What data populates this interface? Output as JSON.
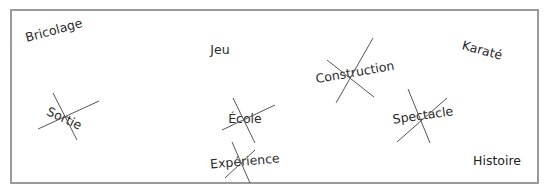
{
  "worksheet": {
    "frame": {
      "x": 11,
      "y": 10,
      "width": 527,
      "height": 173,
      "color": "#9a9a9a"
    },
    "words": [
      {
        "id": "bricolage",
        "text": "Bricolage",
        "x": 54,
        "y": 31,
        "rotate": -15,
        "crossed": false
      },
      {
        "id": "jeu",
        "text": "Jeu",
        "x": 220,
        "y": 50,
        "rotate": 0,
        "crossed": false
      },
      {
        "id": "construction",
        "text": "Construction",
        "x": 355,
        "y": 73,
        "rotate": -10,
        "crossed": true
      },
      {
        "id": "karate",
        "text": "Karaté",
        "x": 482,
        "y": 51,
        "rotate": 15,
        "crossed": false
      },
      {
        "id": "sortie",
        "text": "Sortie",
        "x": 64,
        "y": 119,
        "rotate": 25,
        "crossed": true
      },
      {
        "id": "ecole",
        "text": "École",
        "x": 245,
        "y": 119,
        "rotate": 0,
        "crossed": true
      },
      {
        "id": "spectacle",
        "text": "Spectacle",
        "x": 423,
        "y": 116,
        "rotate": -8,
        "crossed": true
      },
      {
        "id": "experience",
        "text": "Expérience",
        "x": 245,
        "y": 162,
        "rotate": -5,
        "crossed": true
      },
      {
        "id": "histoire",
        "text": "Histoire",
        "x": 497,
        "y": 161,
        "rotate": 0,
        "crossed": false
      }
    ],
    "strike_color": "#555555"
  }
}
